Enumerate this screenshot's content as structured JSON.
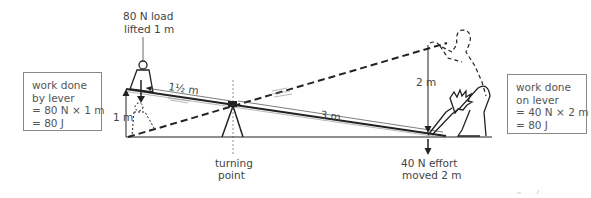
{
  "diagram": {
    "type": "lever-work-diagram",
    "load_label": {
      "line1": "80 N load",
      "line2": "lifted 1 m"
    },
    "pivot_label": {
      "line1": "turning",
      "line2": "point"
    },
    "effort_label": {
      "line1": "40 N effort",
      "line2": "moved 2 m"
    },
    "dimensions": {
      "load_arm": "1½ m",
      "effort_arm": "3 m",
      "load_height": "1 m",
      "effort_height": "2 m"
    },
    "left_box": {
      "lines": [
        "work done",
        "by lever",
        "= 80 N × 1 m",
        "= 80 J"
      ]
    },
    "right_box": {
      "lines": [
        "work done",
        "on lever",
        "= 40 N × 2 m",
        "= 80 J"
      ]
    },
    "colors": {
      "line": "#222222",
      "text": "#444444",
      "box_border": "#888888"
    }
  }
}
